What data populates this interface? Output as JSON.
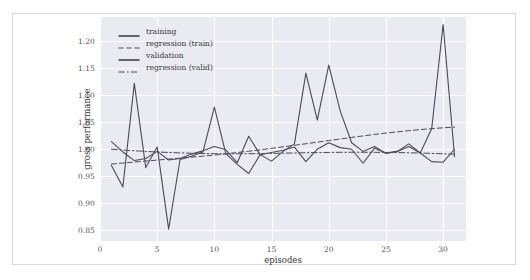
{
  "chart_data": {
    "type": "line",
    "title": "",
    "xlabel": "episodes",
    "ylabel": "gross performance",
    "xlim": [
      0,
      32
    ],
    "ylim": [
      0.83,
      1.245
    ],
    "xticks": [
      0,
      5,
      10,
      15,
      20,
      25,
      30
    ],
    "yticks": [
      "0.85",
      "0.90",
      "0.95",
      "1.00",
      "1.05",
      "1.10",
      "1.15",
      "1.20"
    ],
    "grid": true,
    "legend_position": "upper left",
    "background": "#eaeaf2",
    "gridline_color": "#ffffff",
    "line_color": "#4a4a5a",
    "x": [
      1,
      2,
      3,
      4,
      5,
      6,
      7,
      8,
      9,
      10,
      11,
      12,
      13,
      14,
      15,
      16,
      17,
      18,
      19,
      20,
      21,
      22,
      23,
      24,
      25,
      26,
      27,
      28,
      29,
      30,
      31
    ],
    "series": [
      {
        "name": "training",
        "style": "solid",
        "values": [
          0.97,
          0.93,
          1.122,
          0.966,
          1.004,
          0.852,
          0.981,
          0.987,
          0.995,
          1.078,
          0.992,
          0.972,
          0.955,
          0.99,
          0.978,
          0.996,
          1.01,
          1.141,
          1.054,
          1.156,
          1.071,
          1.012,
          0.996,
          1.005,
          0.992,
          0.996,
          1.005,
          0.993,
          1.038,
          1.231,
          0.986
        ]
      },
      {
        "name": "regression (train)",
        "style": "dashed",
        "values": [
          0.9725,
          0.9744,
          0.9763,
          0.9781,
          0.9799,
          0.9817,
          0.9835,
          0.9853,
          0.9872,
          0.9893,
          0.9915,
          0.9939,
          0.9963,
          0.9989,
          1.0016,
          1.0044,
          1.0073,
          1.0102,
          1.0131,
          1.0161,
          1.019,
          1.0219,
          1.0247,
          1.0274,
          1.0299,
          1.0322,
          1.0344,
          1.0364,
          1.0382,
          1.0397,
          1.041
        ]
      },
      {
        "name": "validation",
        "style": "solid",
        "values": [
          1.014,
          0.995,
          0.979,
          0.983,
          0.996,
          0.98,
          0.983,
          0.991,
          0.997,
          1.005,
          0.999,
          0.975,
          1.024,
          0.99,
          0.994,
          0.998,
          1.004,
          0.977,
          1.0,
          1.012,
          1.003,
          1.0,
          0.974,
          1.002,
          0.993,
          0.996,
          1.01,
          0.993,
          0.977,
          0.976,
          1.0
        ]
      },
      {
        "name": "regression (valid)",
        "style": "dashdot",
        "values": [
          1.0,
          0.9985,
          0.9972,
          0.996,
          0.9949,
          0.994,
          0.9932,
          0.9926,
          0.9921,
          0.9918,
          0.9916,
          0.9916,
          0.9917,
          0.9919,
          0.9923,
          0.9927,
          0.9931,
          0.9935,
          0.9938,
          0.9941,
          0.9943,
          0.9944,
          0.9944,
          0.9943,
          0.9941,
          0.9938,
          0.9934,
          0.9929,
          0.9923,
          0.9916,
          0.9908
        ]
      }
    ],
    "legend": [
      {
        "label": "training",
        "style": "solid"
      },
      {
        "label": "regression (train)",
        "style": "dashed"
      },
      {
        "label": "validation",
        "style": "solid"
      },
      {
        "label": "regression (valid)",
        "style": "dashdot"
      }
    ]
  }
}
